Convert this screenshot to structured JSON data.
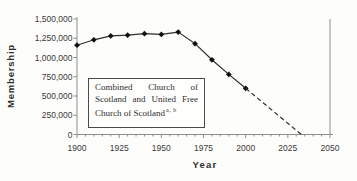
{
  "chart_data": {
    "type": "line",
    "title": "",
    "xlabel": "Year",
    "ylabel": "Membership",
    "xlim": [
      1900,
      2050
    ],
    "ylim": [
      0,
      1500000
    ],
    "x_ticks": [
      "1900",
      "1925",
      "1950",
      "1975",
      "2000",
      "2025",
      "2050"
    ],
    "x_tick_values": [
      1900,
      1925,
      1950,
      1975,
      2000,
      2025,
      2050
    ],
    "x_minor_tick_step": 5,
    "y_ticks": [
      "0",
      "250,000",
      "500,000",
      "750,000",
      "1,000,000",
      "1,250,000",
      "1,500,000"
    ],
    "y_tick_values": [
      0,
      250000,
      500000,
      750000,
      1000000,
      1250000,
      1500000
    ],
    "grid": false,
    "legend": false,
    "line_color": "#2e2e2e",
    "marker_color": "#111111",
    "axis_color": "#8f8f8f",
    "series": [
      {
        "name": "Recorded membership",
        "style": "solid",
        "marker": "diamond",
        "x": [
          1900,
          1910,
          1920,
          1930,
          1940,
          1950,
          1960,
          1970,
          1980,
          1990,
          2000
        ],
        "values": [
          1160000,
          1230000,
          1280000,
          1290000,
          1310000,
          1300000,
          1330000,
          1180000,
          970000,
          780000,
          600000
        ]
      },
      {
        "name": "Projection to zero",
        "style": "dashed",
        "marker": "none",
        "x": [
          2000,
          2033
        ],
        "values": [
          600000,
          0
        ]
      }
    ],
    "annotation": {
      "line1": "Combined Church of",
      "line2": "Scotland and United Free",
      "line3": "Church of Scotland",
      "superscript": "a, b"
    }
  }
}
